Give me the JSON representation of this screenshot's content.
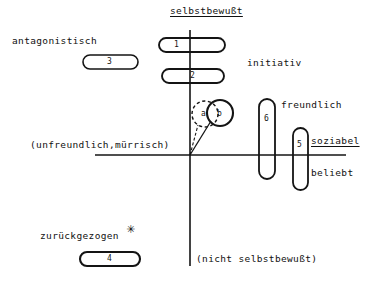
{
  "diagram": {
    "colors": {
      "ink": "#141414",
      "paper": "#ffffff"
    },
    "axes": {
      "top_label": "selbstbewußt",
      "bottom_label": "(nicht selbstbewußt)",
      "left_label": "(unfreundlich,mürrisch)",
      "right_label": "soziabel",
      "origin_x": 190,
      "origin_y": 155,
      "vertical_top": 30,
      "vertical_bottom": 266,
      "horizontal_left": 95,
      "horizontal_right": 346
    },
    "quadrant_labels": [
      {
        "name": "antagonistisch",
        "text": "antagonistisch",
        "x": 12,
        "y": 36
      },
      {
        "name": "initiativ",
        "text": "initiativ",
        "x": 247,
        "y": 58
      },
      {
        "name": "freundlich",
        "text": "freundlich",
        "x": 281,
        "y": 100
      },
      {
        "name": "beliebt",
        "text": "beliebt",
        "x": 311,
        "y": 168
      },
      {
        "name": "zurueckgezogen",
        "text": "zurückgezogen",
        "x": 40,
        "y": 231
      }
    ],
    "markers": [
      {
        "id": "1",
        "label": "1",
        "orientation": "horizontal",
        "x": 159,
        "y": 38,
        "w": 66,
        "h": 14
      },
      {
        "id": "2",
        "label": "2",
        "orientation": "horizontal",
        "x": 162,
        "y": 69,
        "w": 62,
        "h": 14
      },
      {
        "id": "3",
        "label": "3",
        "orientation": "horizontal",
        "x": 83,
        "y": 55,
        "w": 55,
        "h": 14
      },
      {
        "id": "4",
        "label": "4",
        "orientation": "horizontal",
        "x": 80,
        "y": 252,
        "w": 60,
        "h": 14
      },
      {
        "id": "5",
        "label": "5",
        "orientation": "vertical",
        "x": 293,
        "y": 128,
        "w": 15,
        "h": 62
      },
      {
        "id": "6",
        "label": "6",
        "orientation": "vertical",
        "x": 259,
        "y": 99,
        "w": 16,
        "h": 80
      }
    ],
    "circles": [
      {
        "id": "a",
        "label": "a",
        "style": "dashed",
        "cx": 205,
        "cy": 114,
        "r": 13
      },
      {
        "id": "b",
        "label": "b",
        "style": "solid",
        "cx": 220,
        "cy": 113,
        "r": 13
      }
    ],
    "vectors": [
      {
        "name": "vector-to-circle-a",
        "style": "dashed",
        "x1": 190,
        "y1": 155,
        "x2": 197,
        "y2": 124
      },
      {
        "name": "vector-to-circle-b",
        "style": "solid",
        "x1": 190,
        "y1": 155,
        "x2": 210,
        "y2": 120
      }
    ],
    "star_mark": {
      "name": "asterisk-mark",
      "text": "✳",
      "x": 126,
      "y": 224
    }
  }
}
